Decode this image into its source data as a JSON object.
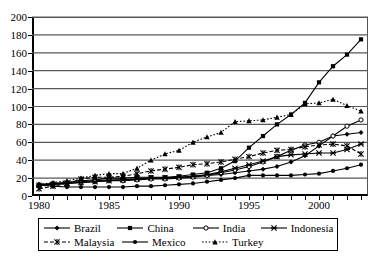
{
  "chart_data": {
    "type": "line",
    "title": "",
    "subtitle": "",
    "xlabel": "",
    "ylabel": "",
    "xlim": [
      1979.5,
      2003.5
    ],
    "ylim": [
      0,
      200
    ],
    "grid": "horizontal",
    "legend_position": "bottom",
    "x": [
      1980,
      1981,
      1982,
      1983,
      1984,
      1985,
      1986,
      1987,
      1988,
      1989,
      1990,
      1991,
      1992,
      1993,
      1994,
      1995,
      1996,
      1997,
      1998,
      1999,
      2000,
      2001,
      2002,
      2003
    ],
    "xticks": [
      1980,
      1985,
      1990,
      1995,
      2000
    ],
    "yticks": [
      0,
      20,
      40,
      60,
      80,
      100,
      120,
      140,
      160,
      180,
      200
    ],
    "series": [
      {
        "name": "Brazil",
        "marker": "diamond",
        "line": "solid",
        "values": [
          13,
          14,
          15,
          16,
          17,
          18,
          18,
          19,
          20,
          20,
          21,
          22,
          23,
          24,
          26,
          28,
          30,
          33,
          38,
          45,
          56,
          67,
          69,
          71
        ]
      },
      {
        "name": "China",
        "marker": "square",
        "line": "solid",
        "values": [
          12,
          14,
          15,
          17,
          18,
          20,
          20,
          21,
          21,
          21,
          22,
          24,
          26,
          31,
          39,
          54,
          67,
          80,
          91,
          104,
          127,
          145,
          158,
          175
        ]
      },
      {
        "name": "India",
        "marker": "open-circle",
        "line": "solid",
        "values": [
          12,
          13,
          14,
          15,
          16,
          17,
          17,
          18,
          19,
          19,
          20,
          21,
          23,
          26,
          29,
          33,
          38,
          44,
          51,
          57,
          60,
          67,
          78,
          85
        ]
      },
      {
        "name": "Indonesia",
        "marker": "star-x",
        "line": "solid",
        "values": [
          12,
          13,
          14,
          15,
          16,
          17,
          18,
          19,
          20,
          20,
          21,
          22,
          24,
          27,
          31,
          35,
          39,
          44,
          46,
          47,
          48,
          48,
          52,
          58
        ]
      },
      {
        "name": "Malaysia",
        "marker": "asterisk",
        "line": "dashed",
        "values": [
          8,
          11,
          14,
          19,
          21,
          21,
          22,
          25,
          28,
          30,
          32,
          35,
          36,
          38,
          41,
          44,
          48,
          51,
          52,
          55,
          57,
          58,
          56,
          47
        ]
      },
      {
        "name": "Mexico",
        "marker": "filled-circle",
        "line": "solid",
        "values": [
          12,
          11,
          10,
          10,
          10,
          10,
          10,
          11,
          11,
          12,
          13,
          14,
          16,
          18,
          20,
          23,
          23,
          23,
          23,
          24,
          25,
          28,
          31,
          35
        ]
      },
      {
        "name": "Turkey",
        "marker": "triangle",
        "line": "dotted",
        "values": [
          13,
          15,
          17,
          20,
          23,
          25,
          25,
          31,
          40,
          47,
          51,
          60,
          66,
          71,
          83,
          84,
          85,
          88,
          91,
          103,
          104,
          108,
          101,
          95
        ]
      }
    ]
  },
  "axes": {
    "y_tick_labels": [
      "200",
      "180",
      "160",
      "140",
      "120",
      "100",
      "80",
      "60",
      "40",
      "20",
      "0"
    ],
    "x_tick_labels": [
      "1980",
      "1985",
      "1990",
      "1995",
      "2000"
    ]
  },
  "legend": {
    "items": [
      {
        "label": "Brazil",
        "marker": "diamond",
        "line": "solid"
      },
      {
        "label": "China",
        "marker": "square",
        "line": "solid"
      },
      {
        "label": "India",
        "marker": "open-circle",
        "line": "solid"
      },
      {
        "label": "Indonesia",
        "marker": "star-x",
        "line": "solid"
      },
      {
        "label": "Malaysia",
        "marker": "asterisk",
        "line": "dashed"
      },
      {
        "label": "Mexico",
        "marker": "filled-circle",
        "line": "solid"
      },
      {
        "label": "Turkey",
        "marker": "triangle",
        "line": "dotted"
      }
    ]
  },
  "colors": {
    "series": "#000000",
    "gridline": "#595959",
    "axis": "#000000",
    "background": "#ffffff"
  }
}
